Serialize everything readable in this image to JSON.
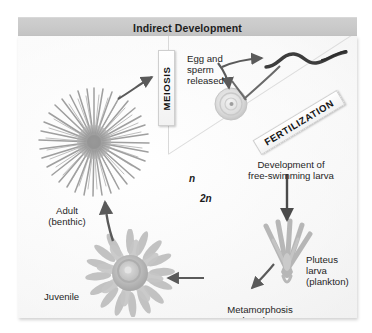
{
  "figure": {
    "title": "Indirect Development",
    "ploidy": {
      "haploid": "n",
      "diploid": "2n"
    },
    "callouts": {
      "meiosis": "MEIOSIS",
      "fertilization": "FERTILIZATION"
    },
    "labels": {
      "egg_sperm_released": "Egg and\nsperm\nreleased",
      "development_free_swimming_larva": "Development of\nfree-swimming larva",
      "pluteus_larva": "Pluteus\nlarva\n(plankton)",
      "metamorphosis": "Metamorphosis\nand settlement\nto sea floor",
      "juvenile": "Juvenile",
      "adult_benthic": "Adult\n(benthic)"
    },
    "organisms": {
      "adult": "sea-urchin-adult",
      "juvenile": "sea-urchin-juvenile",
      "pluteus": "pluteus-larva",
      "egg": "egg-cell",
      "sperm": "sperm-cell"
    },
    "colors": {
      "title_band": "#c9c9c9",
      "panel": "#fbfbfb",
      "text": "#231f20",
      "arrow": "#555555",
      "organism": "#9a9a9a"
    }
  }
}
